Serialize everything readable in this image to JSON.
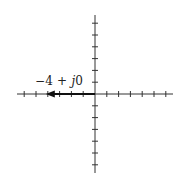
{
  "diagram": {
    "type": "complex-plane-phasor",
    "axes": {
      "origin_px": [
        95,
        94
      ],
      "tick_spacing_px": 11.8,
      "real_axis": {
        "x_from": 17,
        "x_to": 173,
        "ticks_left": 6,
        "ticks_right": 6
      },
      "imag_axis": {
        "y_from": 15,
        "y_to": 173,
        "ticks_up": 6,
        "ticks_down": 6
      },
      "color": "#333333"
    },
    "phasor": {
      "real": -4,
      "imag": 0,
      "color": "#111111"
    },
    "label": {
      "prefix": "−4 + ",
      "j": "j",
      "suffix": "0"
    }
  }
}
